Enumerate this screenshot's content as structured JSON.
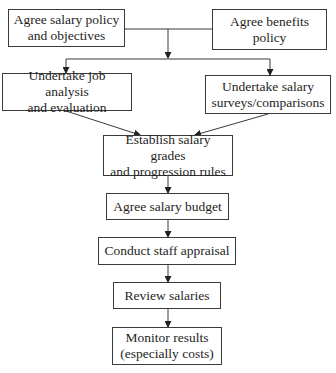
{
  "diagram": {
    "title_partial": "Figure: Steps in developing a salary system",
    "line_color": "#3a3a3a",
    "nodes": [
      {
        "id": "salary-policy",
        "lines": [
          "Agree salary policy",
          "and objectives"
        ]
      },
      {
        "id": "benefits-policy",
        "lines": [
          "Agree benefits",
          "policy"
        ]
      },
      {
        "id": "job-analysis",
        "lines": [
          "Undertake job analysis",
          "and evaluation"
        ]
      },
      {
        "id": "salary-surveys",
        "lines": [
          "Undertake salary",
          "surveys/comparisons"
        ]
      },
      {
        "id": "salary-grades",
        "lines": [
          "Establish salary grades",
          "and progression rules"
        ]
      },
      {
        "id": "salary-budget",
        "lines": [
          "Agree salary budget"
        ]
      },
      {
        "id": "staff-appraisal",
        "lines": [
          "Conduct staff appraisal"
        ]
      },
      {
        "id": "review-salaries",
        "lines": [
          "Review salaries"
        ]
      },
      {
        "id": "monitor-results",
        "lines": [
          "Monitor results",
          "(especially costs)"
        ]
      }
    ],
    "edges": [
      {
        "from": "salary-policy",
        "to": "job-analysis"
      },
      {
        "from": "salary-policy",
        "to": "salary-surveys"
      },
      {
        "from": "benefits-policy",
        "to": "job-analysis"
      },
      {
        "from": "benefits-policy",
        "to": "salary-surveys"
      },
      {
        "from": "job-analysis",
        "to": "salary-grades"
      },
      {
        "from": "salary-surveys",
        "to": "salary-grades"
      },
      {
        "from": "salary-grades",
        "to": "salary-budget"
      },
      {
        "from": "salary-budget",
        "to": "staff-appraisal"
      },
      {
        "from": "staff-appraisal",
        "to": "review-salaries"
      },
      {
        "from": "review-salaries",
        "to": "monitor-results"
      }
    ]
  }
}
